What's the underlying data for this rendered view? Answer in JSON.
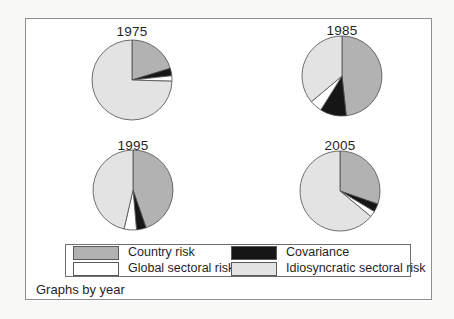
{
  "chart_data": {
    "type": "pie",
    "layout": "2x2 small multiples, one pie per year; legend box bottom-center; slices start at 12 o'clock and run clockwise",
    "note": "Graphs by year",
    "series_labels": [
      "Country risk",
      "Covariance",
      "Global sectoral risk",
      "Idiosyncratic sectoral risk"
    ],
    "series_keys": [
      "country-risk",
      "covariance",
      "global-sectoral-risk",
      "idiosyncratic-sectoral-risk"
    ],
    "colors": [
      "#b2b2b2",
      "#161616",
      "#ffffff",
      "#e3e3e3"
    ],
    "slice_stroke": "#4d4d4d",
    "frame_border_color": "#8f8f8f",
    "legend_border_color": "#6f6f6f",
    "pies": [
      {
        "title": "1975",
        "values": [
          20.3,
          3.0,
          2.2,
          74.5
        ]
      },
      {
        "title": "1985",
        "values": [
          48.3,
          10.6,
          5.0,
          36.1
        ]
      },
      {
        "title": "1995",
        "values": [
          44.7,
          3.9,
          5.0,
          46.4
        ]
      },
      {
        "title": "2005",
        "values": [
          30.3,
          3.3,
          2.4,
          64.0
        ]
      }
    ]
  }
}
